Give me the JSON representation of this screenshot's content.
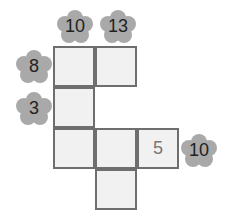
{
  "puzzle": {
    "column_clues": [
      {
        "value": "10",
        "col": 0
      },
      {
        "value": "13",
        "col": 1
      }
    ],
    "row_clues_left": [
      {
        "value": "8",
        "row": 0
      },
      {
        "value": "3",
        "row": 1
      }
    ],
    "row_clues_right": [
      {
        "value": "10",
        "row": 2
      }
    ],
    "cells": [
      {
        "row": 0,
        "col": 0,
        "value": ""
      },
      {
        "row": 0,
        "col": 1,
        "value": ""
      },
      {
        "row": 1,
        "col": 0,
        "value": ""
      },
      {
        "row": 2,
        "col": 0,
        "value": ""
      },
      {
        "row": 2,
        "col": 1,
        "value": ""
      },
      {
        "row": 2,
        "col": 2,
        "value": "5"
      },
      {
        "row": 3,
        "col": 1,
        "value": ""
      }
    ],
    "colors": {
      "cell_fill": "#f1f1f1",
      "cell_border": "#6e6e6e",
      "flower": "#a9a9a9",
      "clue_text": "#222222",
      "given_text": "#777777"
    }
  }
}
